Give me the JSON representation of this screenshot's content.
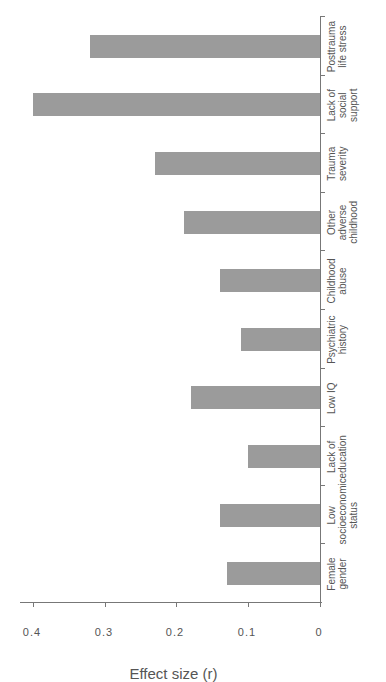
{
  "chart_data": {
    "type": "bar",
    "orientation": "vertical bars, figure rotated 90° counter-clockwise",
    "title": "",
    "xlabel": "",
    "ylabel": "Effect size (r)",
    "ylim": [
      0,
      0.4
    ],
    "yticks": [
      "0",
      "0.1",
      "0.2",
      "0.3",
      "0.4"
    ],
    "grid": false,
    "legend": null,
    "bar_color": "#9b9b9b",
    "categories": [
      "Female\ngender",
      "Low\nsocioeconomic\nstatus",
      "Lack of\neducation",
      "Low IQ",
      "Psychiatric\nhistory",
      "Childhood\nabuse",
      "Other adverse\nchildhood",
      "Trauma\nseverity",
      "Lack of social\nsupport",
      "Posttrauma\nlife stress"
    ],
    "values": [
      0.13,
      0.14,
      0.1,
      0.18,
      0.11,
      0.14,
      0.19,
      0.23,
      0.4,
      0.32
    ]
  }
}
